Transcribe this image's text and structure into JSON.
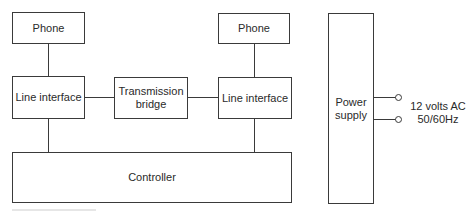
{
  "diagram": {
    "type": "block-diagram",
    "nodes": [
      {
        "id": "phone_left",
        "label": "Phone"
      },
      {
        "id": "line_interface_left",
        "label": "Line interface"
      },
      {
        "id": "transmission_bridge",
        "label": "Transmission\nbridge"
      },
      {
        "id": "phone_right",
        "label": "Phone"
      },
      {
        "id": "line_interface_right",
        "label": "Line interface"
      },
      {
        "id": "controller",
        "label": "Controller"
      },
      {
        "id": "power_supply",
        "label": "Power\nsupply"
      }
    ],
    "edges": [
      {
        "from": "phone_left",
        "to": "line_interface_left"
      },
      {
        "from": "line_interface_left",
        "to": "transmission_bridge"
      },
      {
        "from": "transmission_bridge",
        "to": "line_interface_right"
      },
      {
        "from": "phone_right",
        "to": "line_interface_right"
      },
      {
        "from": "line_interface_left",
        "to": "controller"
      },
      {
        "from": "line_interface_right",
        "to": "controller"
      }
    ],
    "power_input": {
      "terminals": 2,
      "label_line1": "12 volts AC",
      "label_line2": "50/60Hz"
    }
  },
  "colors": {
    "line": "#3a3a3a",
    "background": "#ffffff",
    "text": "#2a2a2a"
  }
}
